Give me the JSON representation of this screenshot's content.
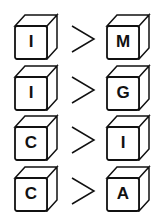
{
  "rows": [
    {
      "left": "I",
      "relation": ">",
      "right": "M"
    },
    {
      "left": "I",
      "relation": ">",
      "right": "G"
    },
    {
      "left": "C",
      "relation": ">",
      "right": "I"
    },
    {
      "left": "C",
      "relation": ">",
      "right": "A"
    }
  ]
}
